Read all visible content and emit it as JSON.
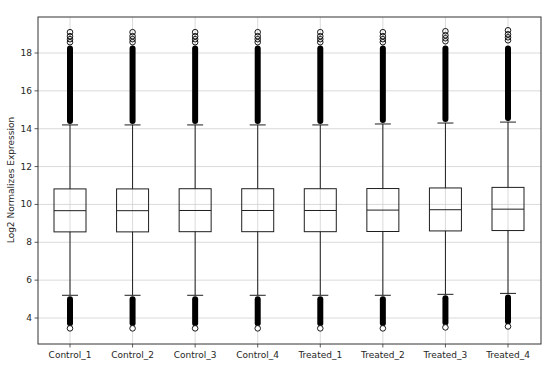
{
  "chart_data": {
    "type": "box",
    "title": "",
    "xlabel": "",
    "ylabel": "Log2 Normalizes Expression",
    "ylim": [
      2.7,
      19.9
    ],
    "yticks": [
      4,
      6,
      8,
      10,
      12,
      14,
      16,
      18
    ],
    "grid": true,
    "legend": null,
    "categories": [
      "Control_1",
      "Control_2",
      "Control_3",
      "Control_4",
      "Treated_1",
      "Treated_2",
      "Treated_3",
      "Treated_4"
    ],
    "series": [
      {
        "name": "Control_1",
        "whisker_low": 5.2,
        "q1": 8.55,
        "median": 9.67,
        "q3": 10.82,
        "whisker_high": 14.2,
        "outliers_low_min": 3.4,
        "outliers_high_max": 19.1
      },
      {
        "name": "Control_2",
        "whisker_low": 5.2,
        "q1": 8.55,
        "median": 9.67,
        "q3": 10.82,
        "whisker_high": 14.2,
        "outliers_low_min": 3.4,
        "outliers_high_max": 19.1
      },
      {
        "name": "Control_3",
        "whisker_low": 5.2,
        "q1": 8.56,
        "median": 9.68,
        "q3": 10.83,
        "whisker_high": 14.2,
        "outliers_low_min": 3.4,
        "outliers_high_max": 19.1
      },
      {
        "name": "Control_4",
        "whisker_low": 5.2,
        "q1": 8.56,
        "median": 9.68,
        "q3": 10.83,
        "whisker_high": 14.2,
        "outliers_low_min": 3.4,
        "outliers_high_max": 19.1
      },
      {
        "name": "Treated_1",
        "whisker_low": 5.2,
        "q1": 8.56,
        "median": 9.68,
        "q3": 10.83,
        "whisker_high": 14.2,
        "outliers_low_min": 3.4,
        "outliers_high_max": 19.1
      },
      {
        "name": "Treated_2",
        "whisker_low": 5.2,
        "q1": 8.57,
        "median": 9.7,
        "q3": 10.84,
        "whisker_high": 14.25,
        "outliers_low_min": 3.4,
        "outliers_high_max": 19.1
      },
      {
        "name": "Treated_3",
        "whisker_low": 5.25,
        "q1": 8.6,
        "median": 9.72,
        "q3": 10.87,
        "whisker_high": 14.3,
        "outliers_low_min": 3.45,
        "outliers_high_max": 19.15
      },
      {
        "name": "Treated_4",
        "whisker_low": 5.3,
        "q1": 8.62,
        "median": 9.75,
        "q3": 10.9,
        "whisker_high": 14.35,
        "outliers_low_min": 3.5,
        "outliers_high_max": 19.2
      }
    ],
    "outlier_dense_top": 18.4,
    "colors": {
      "box": "#1f1f1f",
      "median": "#1f1f1f",
      "grid": "#d0d0d0",
      "axis": "#333333",
      "outlier": "#000000"
    }
  }
}
